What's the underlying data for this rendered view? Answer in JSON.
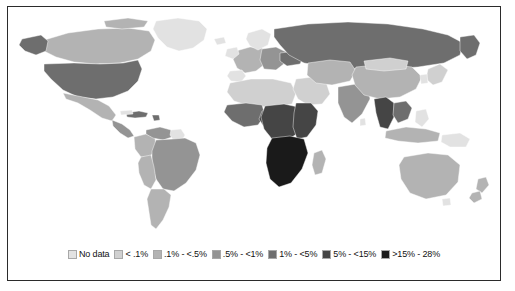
{
  "figure": {
    "type": "choropleth-world-map",
    "frame_color": "#2b2b2b",
    "background": "#ffffff"
  },
  "legend": {
    "name": "prevalence-legend",
    "items": [
      {
        "label": "No data",
        "color": "#e2e2e2"
      },
      {
        "label": "< .1%",
        "color": "#d0d0d0"
      },
      {
        "label": ".1% - <.5%",
        "color": "#b3b3b3"
      },
      {
        "label": ".5% - <1%",
        "color": "#949494"
      },
      {
        "label": "1% - <5%",
        "color": "#6e6e6e"
      },
      {
        "label": "5% - <15%",
        "color": "#454545"
      },
      {
        "label": ">15% - 28%",
        "color": "#1a1a1a"
      }
    ]
  },
  "map": {
    "name": "world-map",
    "regions": [
      {
        "name": "greenland",
        "bin": 0
      },
      {
        "name": "canada",
        "bin": 2
      },
      {
        "name": "alaska",
        "bin": 4
      },
      {
        "name": "united-states",
        "bin": 4
      },
      {
        "name": "mexico",
        "bin": 2
      },
      {
        "name": "central-america",
        "bin": 3
      },
      {
        "name": "caribbean",
        "bin": 4
      },
      {
        "name": "colombia",
        "bin": 2
      },
      {
        "name": "venezuela",
        "bin": 3
      },
      {
        "name": "guyana-region",
        "bin": 5
      },
      {
        "name": "brazil",
        "bin": 3
      },
      {
        "name": "peru-bolivia",
        "bin": 2
      },
      {
        "name": "argentina-chile",
        "bin": 2
      },
      {
        "name": "western-europe",
        "bin": 2
      },
      {
        "name": "eastern-europe",
        "bin": 3
      },
      {
        "name": "ukraine",
        "bin": 4
      },
      {
        "name": "russia",
        "bin": 4
      },
      {
        "name": "north-africa",
        "bin": 1
      },
      {
        "name": "west-africa",
        "bin": 4
      },
      {
        "name": "nigeria",
        "bin": 5
      },
      {
        "name": "central-africa",
        "bin": 5
      },
      {
        "name": "east-africa",
        "bin": 5
      },
      {
        "name": "southern-africa",
        "bin": 6
      },
      {
        "name": "madagascar",
        "bin": 2
      },
      {
        "name": "middle-east",
        "bin": 1
      },
      {
        "name": "central-asia",
        "bin": 2
      },
      {
        "name": "india",
        "bin": 3
      },
      {
        "name": "china",
        "bin": 2
      },
      {
        "name": "mongolia",
        "bin": 1
      },
      {
        "name": "southeast-asia",
        "bin": 4
      },
      {
        "name": "thailand-myanmar",
        "bin": 5
      },
      {
        "name": "indonesia",
        "bin": 2
      },
      {
        "name": "japan-korea",
        "bin": 1
      },
      {
        "name": "australia",
        "bin": 2
      },
      {
        "name": "new-zealand",
        "bin": 2
      }
    ]
  }
}
